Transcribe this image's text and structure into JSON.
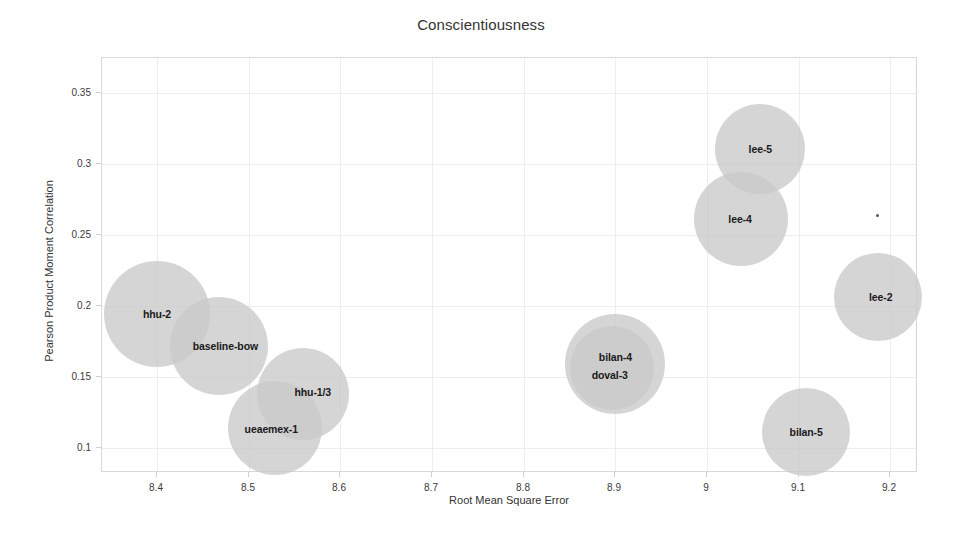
{
  "chart_data": {
    "type": "scatter",
    "title": "Conscientiousness",
    "xlabel": "Root Mean Square Error",
    "ylabel": "Pearson Product Moment Correlation",
    "xlim": [
      8.34,
      9.23
    ],
    "ylim": [
      0.082,
      0.375
    ],
    "grid": true,
    "legend": "none",
    "xticks": [
      "8.4",
      "8.5",
      "8.6",
      "8.7",
      "8.8",
      "8.9",
      "9",
      "9.1",
      "9.2"
    ],
    "xtick_values": [
      8.4,
      8.5,
      8.6,
      8.7,
      8.8,
      8.9,
      9.0,
      9.1,
      9.2
    ],
    "yticks": [
      "0.35",
      "0.3",
      "0.25",
      "0.2",
      "0.15",
      "0.1"
    ],
    "ytick_values": [
      0.35,
      0.3,
      0.25,
      0.2,
      0.15,
      0.1
    ],
    "bubble_color": "#c9c9c9",
    "points": [
      {
        "label": "hhu-2",
        "x": 8.4,
        "y": 0.194,
        "size": 53,
        "label_dx": 0,
        "label_dy": 0
      },
      {
        "label": "baseline-bow",
        "x": 8.468,
        "y": 0.172,
        "size": 49,
        "label_dx": 6,
        "label_dy": 0
      },
      {
        "label": "hhu-1/3",
        "x": 8.559,
        "y": 0.138,
        "size": 46,
        "label_dx": 10,
        "label_dy": -2
      },
      {
        "label": "ueaemex-1",
        "x": 8.529,
        "y": 0.114,
        "size": 47,
        "label_dx": -4,
        "label_dy": 1
      },
      {
        "label": "bilan-4",
        "x": 8.9,
        "y": 0.159,
        "size": 50,
        "label_dx": 0,
        "label_dy": -7
      },
      {
        "label": "doval-3",
        "x": 8.896,
        "y": 0.156,
        "size": 42,
        "label_dx": -2,
        "label_dy": 7
      },
      {
        "label": "lee-5",
        "x": 9.058,
        "y": 0.311,
        "size": 45,
        "label_dx": 0,
        "label_dy": 0
      },
      {
        "label": "lee-4",
        "x": 9.037,
        "y": 0.261,
        "size": 47,
        "label_dx": -1,
        "label_dy": 0
      },
      {
        "label": "lee-2",
        "x": 9.186,
        "y": 0.206,
        "size": 44,
        "label_dx": 3,
        "label_dy": 0
      },
      {
        "label": "bilan-5",
        "x": 9.108,
        "y": 0.111,
        "size": 44,
        "label_dx": 0,
        "label_dy": 0
      },
      {
        "label": "",
        "x": 9.186,
        "y": 0.264,
        "size": 1.5,
        "label_dx": 0,
        "label_dy": 0
      }
    ]
  }
}
